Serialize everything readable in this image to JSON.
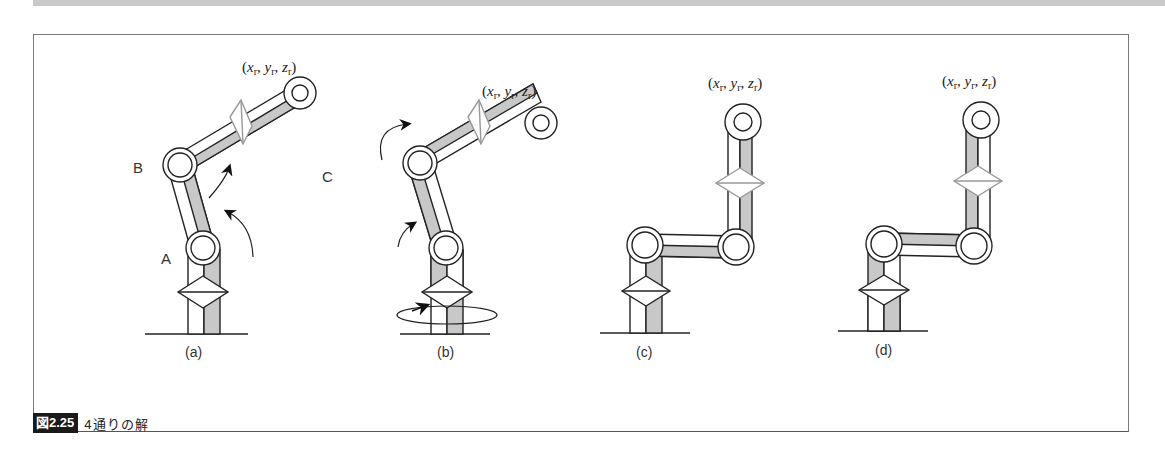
{
  "figure": {
    "number": "図2.25",
    "title": "4通りの解",
    "panels": [
      {
        "id": "a",
        "label": "(a)",
        "coord": "(x",
        "coord_parts": [
          "x",
          "y",
          "z"
        ],
        "target_label": "(xr, yr, zr)",
        "points": {
          "A": "A",
          "B": "B",
          "C": "C"
        }
      },
      {
        "id": "b",
        "label": "(b)",
        "target_label": "(xr, yr, zr)"
      },
      {
        "id": "c",
        "label": "(c)",
        "target_label": "(xr, yr, zr)"
      },
      {
        "id": "d",
        "label": "(d)",
        "target_label": "(xr, yr, zr)"
      }
    ],
    "subscript": "r",
    "colors": {
      "link_fill": "#c8c8c8",
      "line": "#222222",
      "caption_bg": "#1a1a1a"
    }
  }
}
